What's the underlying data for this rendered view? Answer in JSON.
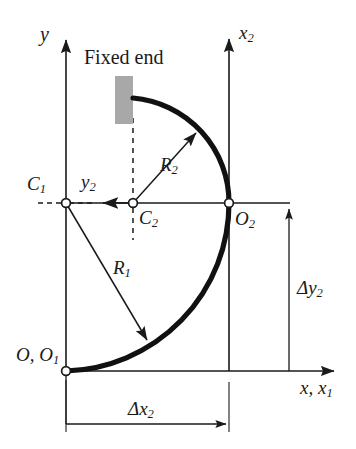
{
  "figure": {
    "type": "engineering-line-diagram",
    "width": 356,
    "height": 449,
    "background_color": "#ffffff",
    "line_color": "#1a1a1a",
    "curve_color": "#111111",
    "block_color": "#a8a8a8"
  },
  "annotations": {
    "fixed_end": "Fixed end",
    "axis_y": "y",
    "axis_x2": "x",
    "axis_x2_sub": "2",
    "axis_x_x1": "x, x",
    "axis_x_x1_sub": "1",
    "axis_y2": "y",
    "axis_y2_sub": "2",
    "point_c1": "C",
    "point_c1_sub": "1",
    "point_c2": "C",
    "point_c2_sub": "2",
    "point_o2": "O",
    "point_o2_sub": "2",
    "point_o_o1": "O, O",
    "point_o_o1_sub": "1",
    "radius_r1": "R",
    "radius_r1_sub": "1",
    "radius_r2": "R",
    "radius_r2_sub": "2",
    "delta_y2": "Δy",
    "delta_y2_sub": "2",
    "delta_x2": "Δx",
    "delta_x2_sub": "2"
  },
  "geometry": {
    "origin_O_O1": [
      66,
      371
    ],
    "point_C1": [
      66,
      203
    ],
    "point_C2": [
      133,
      203
    ],
    "point_O2": [
      229,
      203
    ],
    "y_axis": {
      "x": 66,
      "top": 32,
      "bottom": 449
    },
    "x_axis": {
      "y": 371,
      "left": 66,
      "right": 340
    },
    "x2_axis": {
      "x": 229,
      "top": 31,
      "bottom": 400
    },
    "horizontal_c_line": {
      "y": 203,
      "left": 66,
      "right": 290
    },
    "arc_R1": {
      "center": [
        66,
        203
      ],
      "radius": 168,
      "from": [
        66,
        371
      ],
      "to": [
        229,
        203
      ]
    },
    "arc_R2": {
      "center": [
        133,
        203
      ],
      "radius": 105,
      "from": [
        133,
        98
      ],
      "to": [
        229,
        203
      ]
    },
    "radius_arrow_R1": {
      "from": [
        66,
        203
      ],
      "to": [
        150,
        345
      ]
    },
    "radius_arrow_R2": {
      "from": [
        133,
        203
      ],
      "to": [
        199,
        130
      ]
    },
    "y2_arrow": {
      "from": [
        133,
        203
      ],
      "to": [
        99,
        203
      ]
    },
    "fixed_block": {
      "x": 115,
      "y": 76,
      "width": 18,
      "height": 48
    },
    "dashed_vertical_c2": {
      "x": 133,
      "top": 118,
      "bottom": 240
    },
    "dashed_horizontal_c1": {
      "y": 203,
      "left": 38,
      "right": 66
    },
    "dim_delta_y2": {
      "x": 289,
      "top": 206,
      "bottom": 371
    },
    "dim_delta_x2": {
      "y": 424,
      "left": 66,
      "right": 229
    }
  }
}
